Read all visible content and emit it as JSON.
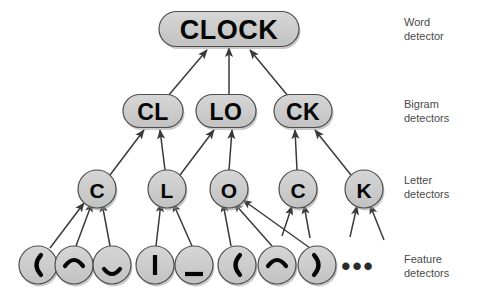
{
  "figure": {
    "background": "#ffffff",
    "node_fill": "#cccccc",
    "node_stroke": "#4d4d4d",
    "text_color": "#050505",
    "label_color": "#4a4a4a",
    "arrow_color": "#3a3a3a"
  },
  "levels": [
    {
      "key": "word",
      "label_line1": "Word",
      "label_line2": "detector"
    },
    {
      "key": "bigram",
      "label_line1": "Bigram",
      "label_line2": "detectors"
    },
    {
      "key": "letter",
      "label_line1": "Letter",
      "label_line2": "detectors"
    },
    {
      "key": "feature",
      "label_line1": "Feature",
      "label_line2": "detectors"
    }
  ],
  "word_nodes": [
    {
      "id": "w-clock",
      "text": "CLOCK",
      "cx": 229,
      "cy": 29,
      "w": 140,
      "h": 35,
      "font_size": 27
    }
  ],
  "bigram_nodes": [
    {
      "id": "b-cl",
      "text": "CL",
      "cx": 153,
      "cy": 111,
      "w": 60,
      "h": 33,
      "font_size": 23
    },
    {
      "id": "b-lo",
      "text": "LO",
      "cx": 226,
      "cy": 111,
      "w": 60,
      "h": 33,
      "font_size": 23
    },
    {
      "id": "b-ck",
      "text": "CK",
      "cx": 303,
      "cy": 111,
      "w": 58,
      "h": 33,
      "font_size": 23
    }
  ],
  "letter_nodes": [
    {
      "id": "l-c1",
      "text": "C",
      "cx": 97,
      "cy": 189,
      "r": 19,
      "font_size": 21
    },
    {
      "id": "l-l",
      "text": "L",
      "cx": 167,
      "cy": 189,
      "r": 19,
      "font_size": 21
    },
    {
      "id": "l-o",
      "text": "O",
      "cx": 229,
      "cy": 189,
      "r": 19,
      "font_size": 21
    },
    {
      "id": "l-c2",
      "text": "C",
      "cx": 298,
      "cy": 189,
      "r": 19,
      "font_size": 21
    },
    {
      "id": "l-k",
      "text": "K",
      "cx": 364,
      "cy": 189,
      "r": 19,
      "font_size": 21
    }
  ],
  "feature_nodes": [
    {
      "id": "f-1",
      "glyph": "left-paren",
      "text": "(",
      "cx": 38,
      "cy": 265,
      "r": 19
    },
    {
      "id": "f-2",
      "glyph": "arc-up",
      "text": "⌒",
      "cx": 74,
      "cy": 265,
      "r": 19
    },
    {
      "id": "f-3",
      "glyph": "arc-down",
      "text": "⌣",
      "cx": 112,
      "cy": 265,
      "r": 19
    },
    {
      "id": "f-4",
      "glyph": "vertical-bar",
      "text": "|",
      "cx": 155,
      "cy": 265,
      "r": 19
    },
    {
      "id": "f-5",
      "glyph": "underscore",
      "text": "_",
      "cx": 194,
      "cy": 265,
      "r": 19
    },
    {
      "id": "f-6",
      "glyph": "left-paren",
      "text": "(",
      "cx": 237,
      "cy": 265,
      "r": 19
    },
    {
      "id": "f-7",
      "glyph": "arc-up",
      "text": "⌒",
      "cx": 277,
      "cy": 265,
      "r": 19
    },
    {
      "id": "f-8",
      "glyph": "right-paren",
      "text": ")",
      "cx": 317,
      "cy": 265,
      "r": 19
    }
  ],
  "ellipsis": {
    "text": "•••",
    "cx": 358,
    "cy": 266
  },
  "edges_bigram_to_word": [
    {
      "from": "b-cl",
      "to": "w-clock",
      "x1": 168,
      "y1": 96,
      "x2": 207,
      "y2": 50
    },
    {
      "from": "b-lo",
      "to": "w-clock",
      "x1": 229,
      "y1": 95,
      "x2": 229,
      "y2": 48
    },
    {
      "from": "b-ck",
      "to": "w-clock",
      "x1": 288,
      "y1": 96,
      "x2": 250,
      "y2": 50
    }
  ],
  "edges_letter_to_bigram": [
    {
      "from": "l-c1",
      "to": "b-cl",
      "x1": 110,
      "y1": 175,
      "x2": 144,
      "y2": 130
    },
    {
      "from": "l-l",
      "to": "b-cl",
      "x1": 165,
      "y1": 170,
      "x2": 160,
      "y2": 130
    },
    {
      "from": "l-l",
      "to": "b-lo",
      "x1": 180,
      "y1": 175,
      "x2": 214,
      "y2": 130
    },
    {
      "from": "l-o",
      "to": "b-lo",
      "x1": 229,
      "y1": 170,
      "x2": 232,
      "y2": 130
    },
    {
      "from": "l-c2",
      "to": "b-ck",
      "x1": 297,
      "y1": 170,
      "x2": 295,
      "y2": 130
    },
    {
      "from": "l-k",
      "to": "b-ck",
      "x1": 351,
      "y1": 175,
      "x2": 315,
      "y2": 130
    }
  ],
  "edges_feature_to_letter": [
    {
      "from": "f-1",
      "to": "l-c1",
      "x1": 50,
      "y1": 248,
      "x2": 84,
      "y2": 203
    },
    {
      "from": "f-2",
      "to": "l-c1",
      "x1": 76,
      "y1": 246,
      "x2": 92,
      "y2": 203
    },
    {
      "from": "f-3",
      "to": "l-c1",
      "x1": 110,
      "y1": 246,
      "x2": 102,
      "y2": 203
    },
    {
      "from": "f-4",
      "to": "l-l",
      "x1": 156,
      "y1": 246,
      "x2": 161,
      "y2": 203
    },
    {
      "from": "f-5",
      "to": "l-l",
      "x1": 192,
      "y1": 246,
      "x2": 173,
      "y2": 203
    },
    {
      "from": "f-6",
      "to": "l-o",
      "x1": 231,
      "y1": 246,
      "x2": 223,
      "y2": 203
    },
    {
      "from": "f-7",
      "to": "l-o",
      "x1": 272,
      "y1": 246,
      "x2": 234,
      "y2": 203
    },
    {
      "from": "f-8",
      "to": "l-o",
      "x1": 310,
      "y1": 248,
      "x2": 243,
      "y2": 200
    }
  ],
  "edges_open_to_letter": [
    {
      "to": "l-c2",
      "x1": 282,
      "y1": 236,
      "x2": 292,
      "y2": 206
    },
    {
      "to": "l-c2",
      "x1": 310,
      "y1": 238,
      "x2": 304,
      "y2": 205
    },
    {
      "to": "l-k",
      "x1": 350,
      "y1": 237,
      "x2": 357,
      "y2": 206
    },
    {
      "to": "l-k",
      "x1": 384,
      "y1": 240,
      "x2": 370,
      "y2": 205
    }
  ],
  "row_labels": [
    {
      "key": "word",
      "x": 404,
      "y": 22,
      "line1": "Word",
      "line2": "detector"
    },
    {
      "key": "bigram",
      "x": 404,
      "y": 104,
      "line1": "Bigram",
      "line2": "detectors"
    },
    {
      "key": "letter",
      "x": 404,
      "y": 180,
      "line1": "Letter",
      "line2": "detectors"
    },
    {
      "key": "feature",
      "x": 404,
      "y": 259,
      "line1": "Feature",
      "line2": "detectors"
    }
  ]
}
